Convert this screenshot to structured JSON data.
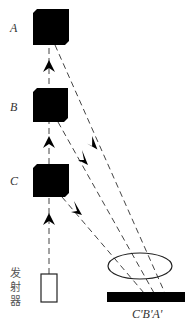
{
  "diagram": {
    "type": "optical-reflection-schematic",
    "objects": [
      {
        "id": "A",
        "label": "A"
      },
      {
        "id": "B",
        "label": "B"
      },
      {
        "id": "C",
        "label": "C"
      }
    ],
    "emitter_label_lines": [
      "发",
      "射",
      "器"
    ],
    "image_label": "C'B'A'",
    "colors": {
      "ink": "#000000",
      "line": "#444444",
      "text": "#333333"
    }
  }
}
